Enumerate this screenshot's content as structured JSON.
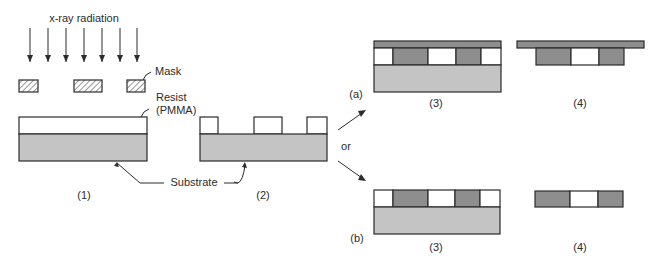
{
  "diagram": {
    "title_label": "x-ray radiation",
    "labels": {
      "mask": "Mask",
      "resist_line1": "Resist",
      "resist_line2": "(PMMA)",
      "substrate": "Substrate",
      "or": "or",
      "branch_a": "(a)",
      "branch_b": "(b)"
    },
    "steps": {
      "step1": "(1)",
      "step2": "(2)",
      "a3": "(3)",
      "a4": "(4)",
      "b3": "(3)",
      "b4": "(4)"
    },
    "colors": {
      "substrate": "#c4c4c4",
      "deposit": "#8e8e8e",
      "resist": "#ffffff",
      "line": "#2b2b2b"
    },
    "arrow_count": 7
  }
}
